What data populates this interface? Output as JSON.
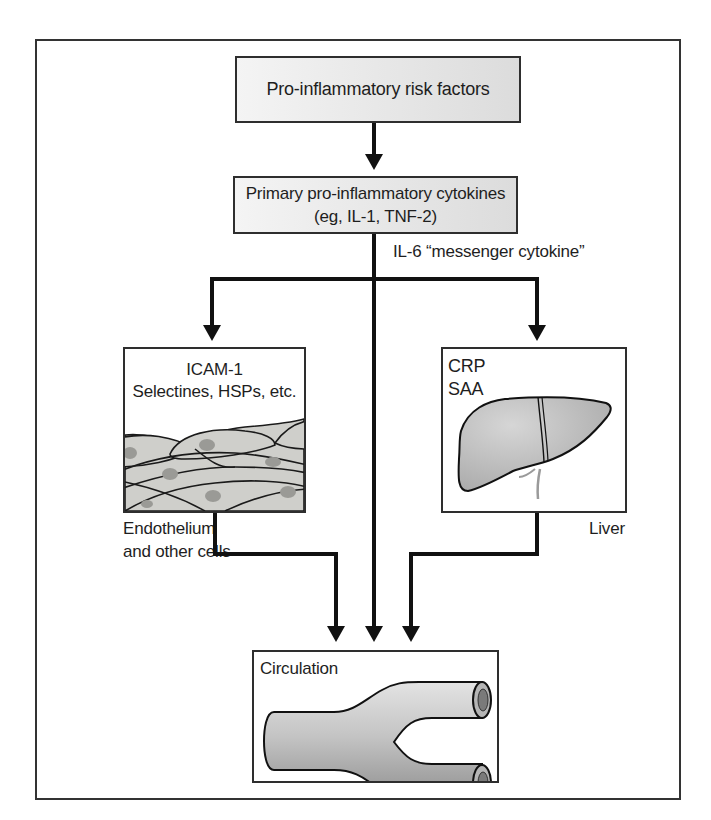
{
  "diagram": {
    "nodes": {
      "risk_factors": {
        "label": "Pro-inflammatory risk factors"
      },
      "primary_cytokines": {
        "line1": "Primary pro-inflammatory cytokines",
        "line2": "(eg, IL-1, TNF-2)"
      },
      "messenger": {
        "label": "IL-6 “messenger cytokine”"
      },
      "endothelium": {
        "line1": "ICAM-1",
        "line2": "Selectines, HSPs, etc.",
        "caption_line1": "Endothelium",
        "caption_line2": "and other cells",
        "illustration": "endothelial-cells"
      },
      "liver": {
        "line1": "CRP",
        "line2": "SAA",
        "caption": "Liver",
        "illustration": "liver"
      },
      "circulation": {
        "label": "Circulation",
        "illustration": "branching-blood-vessel"
      }
    },
    "edges": [
      {
        "from": "risk_factors",
        "to": "primary_cytokines"
      },
      {
        "from": "primary_cytokines",
        "to": "endothelium",
        "via": "messenger"
      },
      {
        "from": "primary_cytokines",
        "to": "liver",
        "via": "messenger"
      },
      {
        "from": "primary_cytokines",
        "to": "circulation",
        "via": "messenger"
      },
      {
        "from": "endothelium",
        "to": "circulation"
      },
      {
        "from": "liver",
        "to": "circulation"
      }
    ],
    "colors": {
      "line": "#111111",
      "box_border": "#2e2e2e",
      "box_fill_gray": "#e6e6e6",
      "tissue_fill": "#cfcfcb",
      "nucleus": "#9a9a96",
      "organ_fill": "#bdbdbd"
    }
  }
}
